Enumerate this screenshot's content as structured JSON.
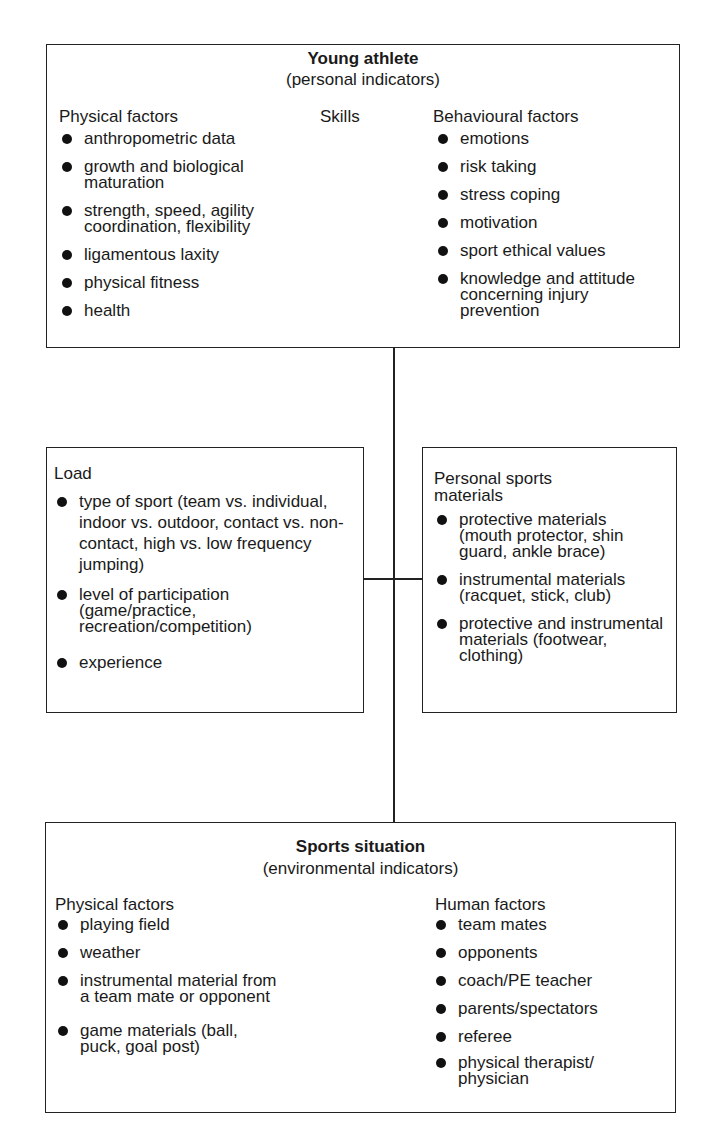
{
  "young_athlete": {
    "title": "Young athlete",
    "subtitle": "(personal indicators)",
    "physical": {
      "heading": "Physical factors",
      "items": [
        "anthropometric data",
        "growth and biological maturation",
        "strength, speed, agility coordination, flexibility",
        "ligamentous laxity",
        "physical fitness",
        "health"
      ]
    },
    "skills": {
      "heading": "Skills"
    },
    "behavioural": {
      "heading": "Behavioural factors",
      "items": [
        "emotions",
        "risk taking",
        "stress coping",
        "motivation",
        "sport ethical values",
        "knowledge and attitude concerning injury prevention"
      ]
    }
  },
  "load": {
    "heading": "Load",
    "items": [
      "type of sport (team vs. individual, indoor vs. outdoor, contact vs. non-contact, high vs. low frequency jumping)",
      "level of participation (game/practice, recreation/competition)",
      "experience"
    ]
  },
  "materials": {
    "heading": "Personal sports materials",
    "items": [
      "protective materials (mouth protector, shin guard, ankle brace)",
      "instrumental materials (racquet, stick, club)",
      "protective and instrumental materials (footwear, clothing)"
    ]
  },
  "sports_situation": {
    "title": "Sports situation",
    "subtitle": "(environmental indicators)",
    "physical": {
      "heading": "Physical factors",
      "items": [
        "playing field",
        "weather",
        "instrumental material from a team mate or opponent",
        "game materials (ball, puck, goal post)"
      ]
    },
    "human": {
      "heading": "Human factors",
      "items": [
        "team mates",
        "opponents",
        "coach/PE teacher",
        "parents/spectators",
        "referee",
        "physical therapist/ physician"
      ]
    }
  }
}
